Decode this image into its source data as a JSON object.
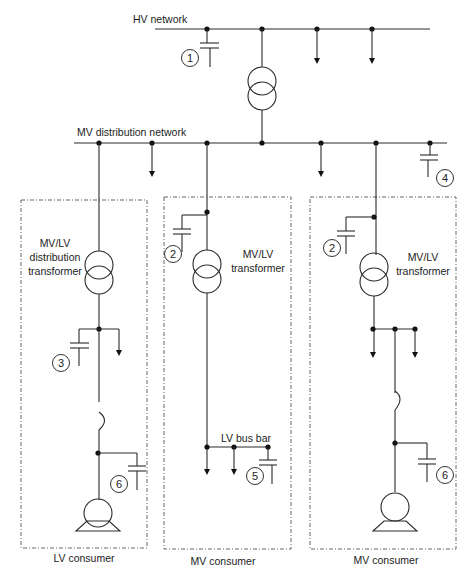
{
  "labels": {
    "hv_network": "HV network",
    "mv_network": "MV distribution network",
    "t_lv_line1": "MV/LV",
    "t_lv_line2": "distribution",
    "t_lv_line3": "transformer",
    "t_mv1_line1": "MV/LV",
    "t_mv1_line2": "transformer",
    "t_mv2_line1": "MV/LV",
    "t_mv2_line2": "transformer",
    "lv_bus_bar": "LV bus bar",
    "lv_consumer": "LV consumer",
    "mv_consumer_1": "MV consumer",
    "mv_consumer_2": "MV consumer"
  },
  "capacitor_markers": {
    "c1": "1",
    "c2a": "2",
    "c2b": "2",
    "c3": "3",
    "c4": "4",
    "c5": "5",
    "c6a": "6",
    "c6b": "6"
  }
}
